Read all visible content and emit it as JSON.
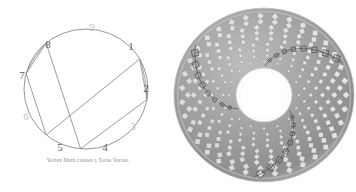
{
  "page": {
    "background": "#ffffff",
    "width": 356,
    "height": 192
  },
  "figure": {
    "caption": "Vortex Math creates a Torus Vortex.",
    "caption_color": "#8d8d8d"
  },
  "vortex_diagram": {
    "title": "Vortex math doubling circle",
    "circle": {
      "cx": 86,
      "cy": 89,
      "rx": 62,
      "ry": 60,
      "stroke": "#8a8a8a"
    },
    "number_color": "#5c5c5c",
    "faint_number_color": "#c2c2c2",
    "nodes": [
      {
        "label": "1",
        "angle_deg": 30,
        "x": 131,
        "y": 47,
        "faint": false
      },
      {
        "label": "2",
        "angle_deg": 350,
        "x": 146,
        "y": 89,
        "faint": false
      },
      {
        "label": "3",
        "angle_deg": 310,
        "x": 133,
        "y": 127,
        "faint": true
      },
      {
        "label": "4",
        "angle_deg": 265,
        "x": 105,
        "y": 148,
        "faint": false
      },
      {
        "label": "5",
        "angle_deg": 230,
        "x": 60,
        "y": 148,
        "faint": false
      },
      {
        "label": "6",
        "angle_deg": 195,
        "x": 26,
        "y": 117,
        "faint": true
      },
      {
        "label": "7",
        "angle_deg": 165,
        "x": 22,
        "y": 76,
        "faint": false
      },
      {
        "label": "8",
        "angle_deg": 130,
        "x": 48,
        "y": 45,
        "faint": false
      },
      {
        "label": "9",
        "angle_deg": 80,
        "x": 92,
        "y": 28,
        "faint": true
      }
    ],
    "doubling_circuit": [
      "1",
      "2",
      "4",
      "8",
      "7",
      "5",
      "1"
    ],
    "edges": [
      {
        "from": "1",
        "to": "2",
        "kind": "short-chord"
      },
      {
        "from": "2",
        "to": "4",
        "kind": "chord"
      },
      {
        "from": "4",
        "to": "8",
        "kind": "long-chord"
      },
      {
        "from": "8",
        "to": "7",
        "kind": "short-chord"
      },
      {
        "from": "7",
        "to": "5",
        "kind": "chord"
      },
      {
        "from": "5",
        "to": "1",
        "kind": "long-chord"
      }
    ],
    "line_color": "#8a8a8a"
  },
  "torus": {
    "title": "Torus vortex mesh",
    "center": {
      "cx": 92,
      "cy": 93
    },
    "outer_radius": 90,
    "hole_radius": 28,
    "hole_color": "#ffffff",
    "body_color": "#9a9a9a",
    "tile_color": "#e9e9e9",
    "seam_color": "#4a4a4a",
    "rim_highlight": "#cfcfcf",
    "tile_shape": "diamond",
    "seam_count": 3,
    "radial_rings": 9,
    "tiles_per_ring": 36
  }
}
